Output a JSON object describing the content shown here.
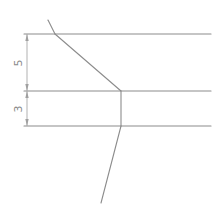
{
  "diagram": {
    "type": "technical-drawing",
    "colors": {
      "line": "#8c8c8c",
      "dimension": "#a8a8a8",
      "text": "#8a8a8a",
      "background": "#ffffff"
    },
    "dimensions": [
      {
        "label": "5",
        "from_y": 34,
        "to_y": 91,
        "x": 27
      },
      {
        "label": "3",
        "from_y": 91,
        "to_y": 126,
        "x": 27
      }
    ],
    "lines": {
      "top_horizontal": {
        "x1": 24,
        "y1": 34,
        "x2": 211,
        "y2": 34
      },
      "middle_horizontal": {
        "x1": 24,
        "y1": 91,
        "x2": 211,
        "y2": 91
      },
      "bottom_horizontal": {
        "x1": 24,
        "y1": 126,
        "x2": 211,
        "y2": 126
      },
      "upper_kink": {
        "x1": 48,
        "y1": 20,
        "x2": 55,
        "y2": 34
      },
      "diagonal": {
        "x1": 55,
        "y1": 34,
        "x2": 121,
        "y2": 91
      },
      "vertical": {
        "x1": 121,
        "y1": 91,
        "x2": 121,
        "y2": 126
      },
      "lower_slant": {
        "x1": 121,
        "y1": 126,
        "x2": 101,
        "y2": 203
      }
    }
  }
}
